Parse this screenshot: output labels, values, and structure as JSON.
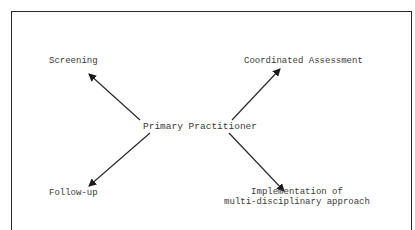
{
  "diagram": {
    "center_node": {
      "label": "Primary Practitioner"
    },
    "nodes": [
      {
        "id": "screening",
        "label": "Screening",
        "position": "top-left"
      },
      {
        "id": "coordinated-assessment",
        "label": "Coordinated Assessment",
        "position": "top-right"
      },
      {
        "id": "follow-up",
        "label": "Follow-up",
        "position": "bottom-left"
      },
      {
        "id": "implementation",
        "label_lines": [
          "Implementation of",
          "multi-disciplinary approach"
        ],
        "position": "bottom-right"
      }
    ],
    "edges": [
      {
        "from": "Primary Practitioner",
        "to": "Screening",
        "direction": "outward"
      },
      {
        "from": "Primary Practitioner",
        "to": "Coordinated Assessment",
        "direction": "outward"
      },
      {
        "from": "Primary Practitioner",
        "to": "Follow-up",
        "direction": "outward"
      },
      {
        "from": "Primary Practitioner",
        "to": "Implementation of multi-disciplinary approach",
        "direction": "outward"
      }
    ],
    "colors": {
      "line": "#2a2a2a",
      "text": "#3a3a3a",
      "background": "#ffffff"
    }
  }
}
